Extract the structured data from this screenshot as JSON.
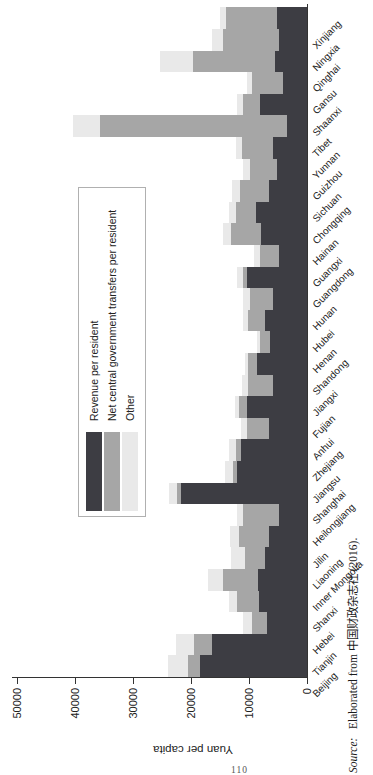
{
  "page": {
    "number": "110"
  },
  "source": {
    "prefix": "Source:",
    "text": "Elaborated from 中国财政杂志社 (2016)."
  },
  "chart_data": {
    "type": "bar",
    "subtype": "stacked-vertical, whole figure rotated 90° CCW on the page",
    "title": "",
    "xlabel": "",
    "ylabel": "Yuan per capita",
    "ylim": [
      0,
      50000
    ],
    "yticks": [
      0,
      10000,
      20000,
      30000,
      40000,
      50000
    ],
    "grid": false,
    "legend_position": "upper-left-inside-box",
    "categories": [
      "Beijing",
      "Tianjin",
      "Hebei",
      "Shanxi",
      "Inner Mongolia",
      "Liaoning",
      "Jilin",
      "Heilongjiang",
      "Shanghai",
      "Jiangsu",
      "Zhejiang",
      "Anhui",
      "Fujian",
      "Jiangxi",
      "Shandong",
      "Henan",
      "Hubei",
      "Hunan",
      "Guangdong",
      "Guangxi",
      "Hainan",
      "Chongqing",
      "Sichuan",
      "Guizhou",
      "Yunnan",
      "Tibet",
      "Shaanxi",
      "Gansu",
      "Qinghai",
      "Ningxia",
      "Xinjiang"
    ],
    "series": [
      {
        "name": "Revenue per resident",
        "color": "#3d3d43",
        "values": [
          18400,
          16300,
          6900,
          8300,
          8400,
          7200,
          6500,
          4900,
          21800,
          12100,
          11300,
          6500,
          10400,
          5800,
          8600,
          6400,
          7200,
          5900,
          10400,
          4900,
          7900,
          8800,
          6600,
          5200,
          5800,
          3500,
          8100,
          4200,
          5500,
          4900,
          5200
        ]
      },
      {
        "name": "Net central government transfers per resident",
        "color": "#a6a6a6",
        "values": [
          2200,
          3100,
          2600,
          3800,
          6000,
          3500,
          5200,
          6100,
          600,
          700,
          1000,
          3800,
          1300,
          4300,
          1500,
          1700,
          2900,
          3900,
          700,
          3200,
          5200,
          3400,
          5000,
          4600,
          5400,
          32200,
          3000,
          5300,
          14100,
          9500,
          8800
        ]
      },
      {
        "name": "Other",
        "color": "#e9e9e9",
        "values": [
          3300,
          3200,
          1500,
          1300,
          2600,
          2400,
          1500,
          1100,
          1400,
          1300,
          1100,
          1100,
          700,
          1100,
          600,
          500,
          1000,
          1200,
          1000,
          1000,
          1400,
          1200,
          1300,
          1300,
          1000,
          4700,
          1000,
          900,
          5700,
          2000,
          1000
        ]
      }
    ]
  }
}
